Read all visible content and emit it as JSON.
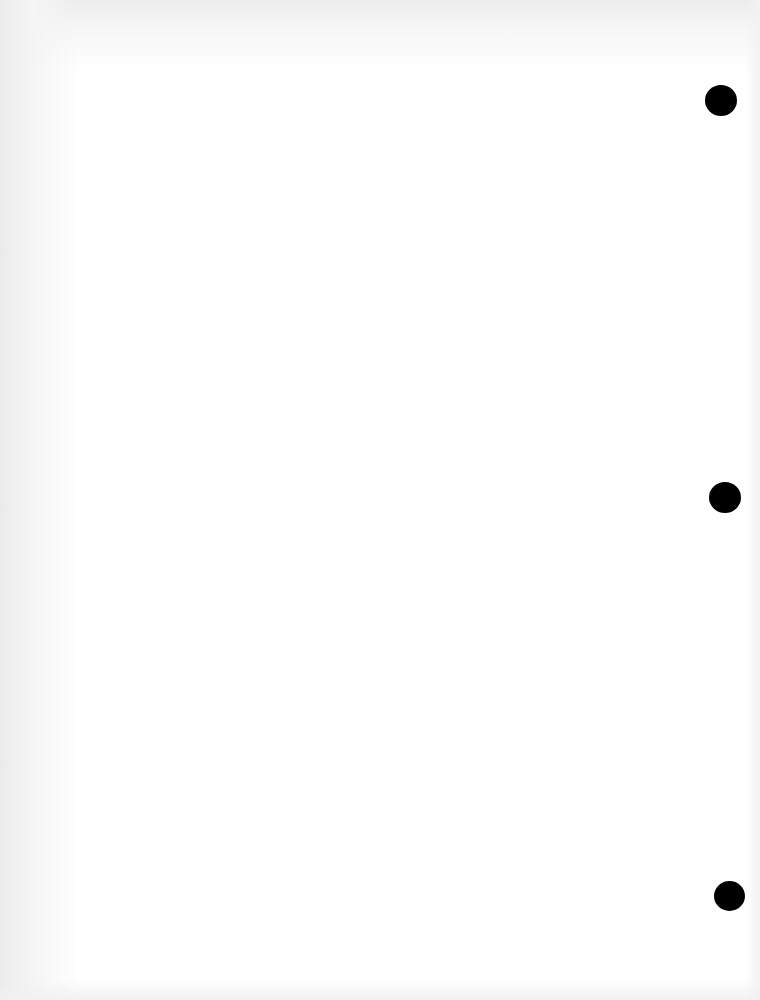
{
  "document": {
    "type": "blank-scanned-page",
    "background_color": "#ffffff",
    "edge_shade_color": "#ebebeb",
    "text_content": ""
  },
  "punch_holes": [
    {
      "cx": 721,
      "cy": 100,
      "w": 32,
      "h": 31,
      "color": "#000000"
    },
    {
      "cx": 725,
      "cy": 497,
      "w": 32,
      "h": 31,
      "color": "#000000"
    },
    {
      "cx": 729,
      "cy": 896,
      "w": 31,
      "h": 30,
      "color": "#000000"
    }
  ]
}
